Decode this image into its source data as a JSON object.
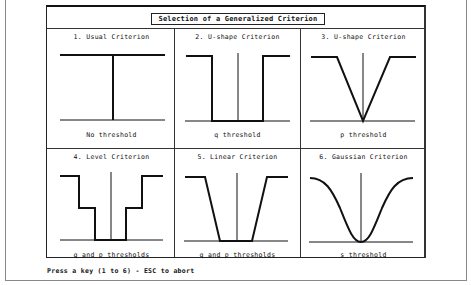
{
  "window": {
    "title": "Selection of a Generalized Criterion"
  },
  "criteria": [
    {
      "number": "1.",
      "title": "1. Usual Criterion",
      "caption": "No threshold",
      "shape": "step"
    },
    {
      "number": "2.",
      "title": "2. U-shape Criterion",
      "caption": "q threshold",
      "shape": "u-shape"
    },
    {
      "number": "3.",
      "title": "3. U-shape Criterion",
      "caption": "p threshold",
      "shape": "v-shape"
    },
    {
      "number": "4.",
      "title": "4. Level Criterion",
      "caption": "q and p thresholds",
      "shape": "level"
    },
    {
      "number": "5.",
      "title": "5. Linear Criterion",
      "caption": "q and p thresholds",
      "shape": "linear"
    },
    {
      "number": "6.",
      "title": "6. Gaussian Criterion",
      "caption": "s threshold",
      "shape": "gaussian"
    }
  ],
  "prompt": "Press a key (1 to 6) - ESC to abort"
}
